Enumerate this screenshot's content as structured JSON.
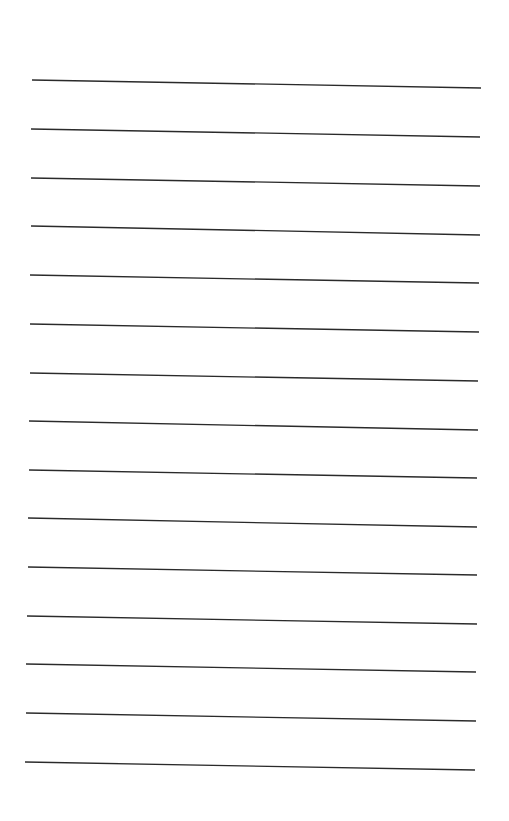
{
  "page": {
    "type": "lined-paper",
    "background": "#ffffff",
    "line_color": "#2a2a2a",
    "line_count": 15,
    "lines": [
      {
        "x1": 32,
        "y1": 80,
        "x2": 481,
        "y2": 88
      },
      {
        "x1": 31,
        "y1": 129,
        "x2": 480,
        "y2": 137
      },
      {
        "x1": 31,
        "y1": 178,
        "x2": 480,
        "y2": 186
      },
      {
        "x1": 31,
        "y1": 226,
        "x2": 480,
        "y2": 235
      },
      {
        "x1": 30,
        "y1": 275,
        "x2": 479,
        "y2": 283
      },
      {
        "x1": 30,
        "y1": 324,
        "x2": 479,
        "y2": 332
      },
      {
        "x1": 30,
        "y1": 373,
        "x2": 478,
        "y2": 381
      },
      {
        "x1": 29,
        "y1": 421,
        "x2": 478,
        "y2": 430
      },
      {
        "x1": 29,
        "y1": 470,
        "x2": 477,
        "y2": 478
      },
      {
        "x1": 28,
        "y1": 518,
        "x2": 477,
        "y2": 527
      },
      {
        "x1": 28,
        "y1": 567,
        "x2": 477,
        "y2": 575
      },
      {
        "x1": 27,
        "y1": 616,
        "x2": 477,
        "y2": 624
      },
      {
        "x1": 26,
        "y1": 664,
        "x2": 476,
        "y2": 672
      },
      {
        "x1": 26,
        "y1": 713,
        "x2": 476,
        "y2": 721
      },
      {
        "x1": 25,
        "y1": 762,
        "x2": 475,
        "y2": 770
      }
    ]
  }
}
